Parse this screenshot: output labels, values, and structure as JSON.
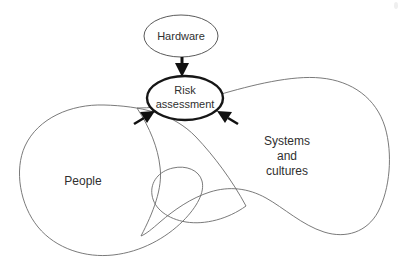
{
  "diagram": {
    "background_color": "#ffffff",
    "nodes": [
      {
        "id": "hardware",
        "label": "Hardware",
        "shape": "ellipse",
        "emphasis": "normal",
        "stroke_color": "#5a5a5a",
        "cx": 181,
        "cy": 36,
        "rx": 37,
        "ry": 21
      },
      {
        "id": "risk-assessment",
        "label_line1": "Risk",
        "label_line2": "assessment",
        "shape": "ellipse",
        "emphasis": "bold",
        "stroke_color": "#161616",
        "cx": 185,
        "cy": 98,
        "rx": 38,
        "ry": 22
      }
    ],
    "regions": [
      {
        "id": "people",
        "label": "People",
        "shape": "blob",
        "stroke_color": "#6b6b6b",
        "label_x": 83,
        "label_y": 182
      },
      {
        "id": "systems-and-cultures",
        "label_line1": "Systems",
        "label_line2": "and",
        "label_line3": "cultures",
        "shape": "blob",
        "stroke_color": "#6b6b6b",
        "label_x": 287,
        "label_y": 155
      }
    ],
    "arrows": [
      {
        "id": "hardware-to-risk",
        "from": "hardware",
        "to": "risk-assessment",
        "direction": "down",
        "color": "#101010"
      },
      {
        "id": "people-to-risk",
        "from": "people",
        "to": "risk-assessment",
        "direction": "up-right",
        "color": "#101010"
      },
      {
        "id": "systems-to-risk",
        "from": "systems-and-cultures",
        "to": "risk-assessment",
        "direction": "up-left",
        "color": "#101010"
      }
    ]
  }
}
